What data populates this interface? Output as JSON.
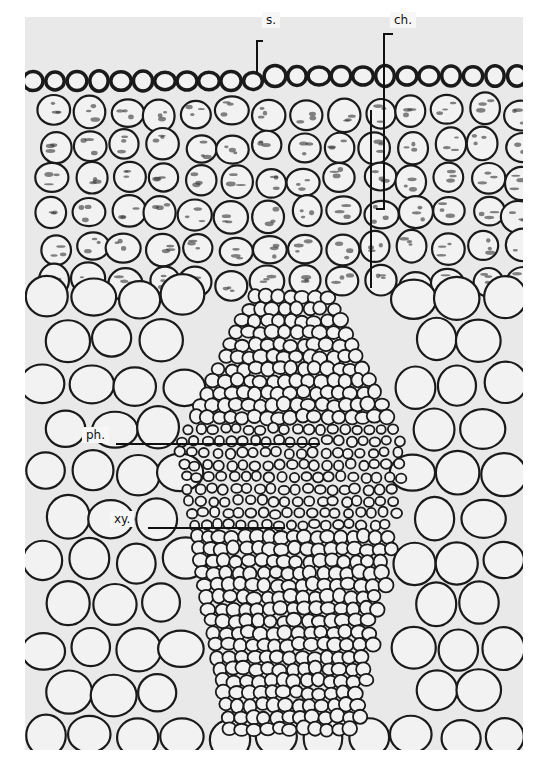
{
  "figure": {
    "labels": [
      {
        "id": "s",
        "text": "s.",
        "x": 262,
        "y": 12
      },
      {
        "id": "ch",
        "text": "ch.",
        "x": 390,
        "y": 12
      },
      {
        "id": "ph",
        "text": "ph.",
        "x": 82,
        "y": 427
      },
      {
        "id": "xy",
        "text": "xy.",
        "x": 110,
        "y": 511
      }
    ],
    "leaders": {
      "s": {
        "bracket_x": 256,
        "top": 40,
        "bottom": 73
      },
      "ch": {
        "bracket_x": 383,
        "top": 33,
        "bottom": 208,
        "inner_x": 370,
        "inner_bottom": 288
      },
      "ph": {
        "x1": 116,
        "x2": 320,
        "y": 443
      },
      "xy": {
        "x1": 148,
        "x2": 285,
        "y": 527
      }
    },
    "colors": {
      "background": "#e9e9e9",
      "cell_wall": "#1a1a1a",
      "cell_lumen": "#f2f2f2",
      "label_bg": "#f7f7f7"
    }
  }
}
